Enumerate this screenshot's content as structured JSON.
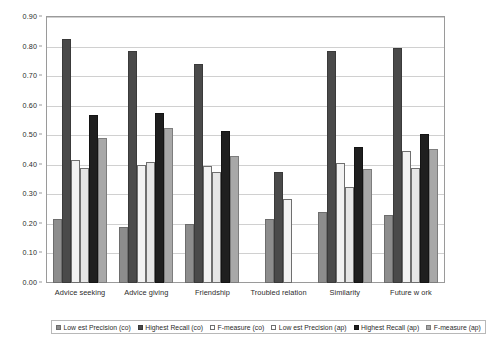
{
  "chart_data": {
    "type": "bar",
    "title": "",
    "subtitle": "",
    "xlabel": "",
    "ylabel": "",
    "ylim": [
      0.0,
      0.9
    ],
    "ytick_labels": [
      "0.00",
      "0.10",
      "0.20",
      "0.30",
      "0.40",
      "0.50",
      "0.60",
      "0.70",
      "0.80",
      "0.90"
    ],
    "ytick_values": [
      0.0,
      0.1,
      0.2,
      0.3,
      0.4,
      0.5,
      0.6,
      0.7,
      0.8,
      0.9
    ],
    "grid": true,
    "grid_axis": "y",
    "legend_position": "bottom",
    "categories": [
      "Advice seeking",
      "Advice giving",
      "Friendship",
      "Troubled relation",
      "Similarity",
      "Future w ork"
    ],
    "series": [
      {
        "name": "Low est Precision (co)",
        "color": "#8d8d8d",
        "values": [
          0.215,
          0.19,
          0.2,
          0.215,
          0.24,
          0.23
        ]
      },
      {
        "name": "Highest Recall (co)",
        "color": "#4a4a4a",
        "values": [
          0.825,
          0.785,
          0.74,
          0.375,
          0.785,
          0.795
        ]
      },
      {
        "name": "F-measure (co)",
        "color": "#f2f2f2",
        "values": [
          0.415,
          0.4,
          0.395,
          0.285,
          0.405,
          0.445
        ]
      },
      {
        "name": "Low est Precision (ap)",
        "color": "#e6e6e6",
        "values": [
          0.39,
          0.41,
          0.375,
          null,
          0.325,
          0.39
        ]
      },
      {
        "name": "Highest Recall (ap)",
        "color": "#1f1f1f",
        "values": [
          0.57,
          0.575,
          0.515,
          null,
          0.46,
          0.505
        ]
      },
      {
        "name": "F-measure (ap)",
        "color": "#a8a8a8",
        "values": [
          0.49,
          0.525,
          0.43,
          null,
          0.385,
          0.455
        ]
      }
    ]
  }
}
